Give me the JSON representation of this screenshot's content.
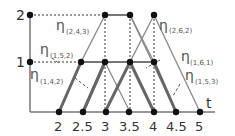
{
  "diagram": {
    "axis": {
      "x_label": "t",
      "x_ticks": [
        "2",
        "2.5",
        "3",
        "3.5",
        "4",
        "4.5",
        "5"
      ],
      "y_ticks": [
        "1",
        "2"
      ]
    },
    "curves": [
      {
        "symbol": "η",
        "subscript": "(2,4,3)"
      },
      {
        "symbol": "η",
        "subscript": "(2,6,2)"
      },
      {
        "symbol": "η",
        "subscript": "(1,5,2)"
      },
      {
        "symbol": "η",
        "subscript": "(1,4,2)"
      },
      {
        "symbol": "η",
        "subscript": "(1,6,1)"
      },
      {
        "symbol": "η",
        "subscript": "(1,5,3)"
      }
    ]
  }
}
